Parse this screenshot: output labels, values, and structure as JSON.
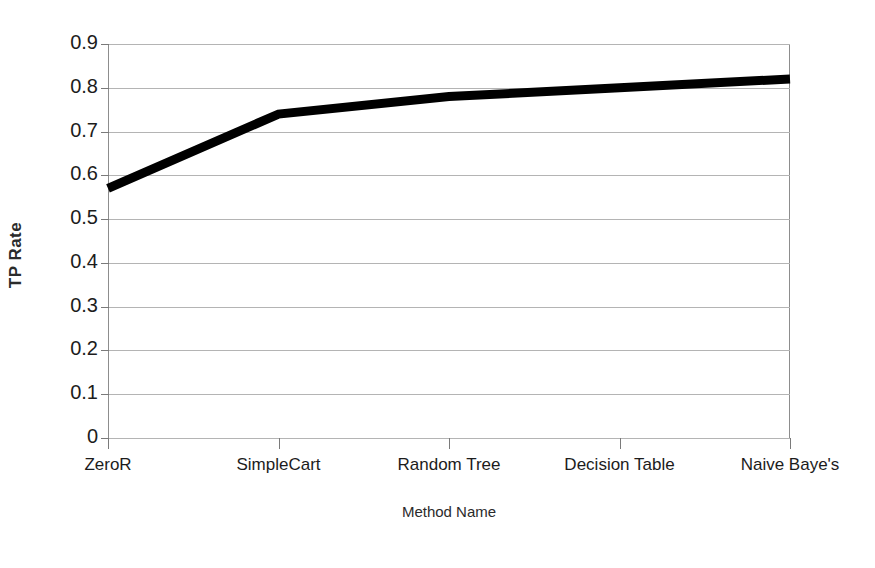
{
  "chart_data": {
    "type": "line",
    "title": "",
    "xlabel": "Method Name",
    "ylabel": "TP Rate",
    "categories": [
      "ZeroR",
      "SimpleCart",
      "Random Tree",
      "Decision Table",
      "Naive Baye's"
    ],
    "values": [
      0.57,
      0.74,
      0.78,
      0.8,
      0.82
    ],
    "series": [
      {
        "name": "TP Rate",
        "values": [
          0.57,
          0.74,
          0.78,
          0.8,
          0.82
        ],
        "color": "#000000"
      }
    ],
    "ylim": [
      0,
      0.9
    ],
    "ytick_labels": [
      "0.9",
      "0.8",
      "0.7",
      "0.6",
      "0.5",
      "0.4",
      "0.3",
      "0.2",
      "0.1",
      "0"
    ],
    "ytick_values": [
      0.9,
      0.8,
      0.7,
      0.6,
      0.5,
      0.4,
      0.3,
      0.2,
      0.1,
      0
    ],
    "grid": true,
    "grid_color": "#b4b4b4",
    "legend": "none",
    "axis_color": "#8d8d8d",
    "line_color": "#000000",
    "line_width": 9,
    "background": "#ffffff"
  },
  "axes": {
    "y_title": "TP Rate",
    "x_title": "Method Name"
  }
}
